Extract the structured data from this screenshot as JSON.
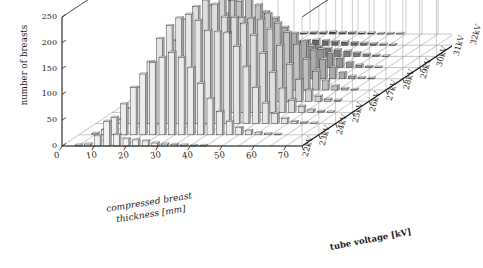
{
  "figure": {
    "type": "3d-bar-histogram",
    "background": "#ffffff",
    "ink": "#1a1a1a"
  },
  "axes": {
    "y": {
      "label": "number of breasts",
      "ticks": [
        "0",
        "50",
        "100",
        "150",
        "200",
        "250"
      ],
      "tick_values": [
        0,
        50,
        100,
        150,
        200,
        250
      ],
      "range": [
        0,
        250
      ]
    },
    "x": {
      "label_line1": "compressed breast",
      "label_line2": "thickness [mm]",
      "label": "compressed breast thickness [mm]",
      "ticks": [
        "0",
        "10",
        "20",
        "30",
        "40",
        "50",
        "60",
        "70"
      ],
      "tick_values": [
        0,
        10,
        20,
        30,
        40,
        50,
        60,
        70
      ],
      "range": [
        0,
        75
      ]
    },
    "z": {
      "label": "tube voltage [kV]",
      "ticks": [
        "22kV",
        "23kV",
        "24kV",
        "25kV",
        "26kV",
        "27kV",
        "28kV",
        "29kV",
        "30kV",
        "31kV",
        "32kV"
      ],
      "tick_values": [
        22,
        23,
        24,
        25,
        26,
        27,
        28,
        29,
        30,
        31,
        32
      ]
    }
  },
  "chart_data": {
    "type": "bar",
    "title": "",
    "subtitle": "",
    "xlabel": "compressed breast thickness [mm]",
    "ylabel": "number of breasts",
    "zlabel": "tube voltage [kV]",
    "xlim": [
      0,
      75
    ],
    "ylim": [
      0,
      250
    ],
    "grid": true,
    "legend_position": "none",
    "projection": "3d",
    "categories": [
      2,
      5,
      8,
      11,
      14,
      17,
      20,
      23,
      26,
      29,
      32,
      35,
      38,
      41,
      44,
      47,
      50,
      53,
      56,
      59,
      62,
      65,
      68,
      71
    ],
    "series": [
      {
        "name": "22kV",
        "z": 22,
        "color": "#f2f2f2",
        "values": [
          0,
          2,
          4,
          20,
          48,
          22,
          14,
          12,
          10,
          6,
          4,
          3,
          2,
          1,
          1,
          0,
          0,
          0,
          0,
          0,
          0,
          0,
          0,
          0
        ]
      },
      {
        "name": "23kV",
        "z": 23,
        "color": "#ededed",
        "values": [
          0,
          3,
          10,
          34,
          60,
          92,
          118,
          140,
          150,
          160,
          150,
          130,
          100,
          70,
          45,
          26,
          14,
          8,
          4,
          2,
          1,
          0,
          0,
          0
        ]
      },
      {
        "name": "24kV",
        "z": 24,
        "color": "#e6e6e6",
        "values": [
          0,
          2,
          8,
          30,
          70,
          120,
          165,
          190,
          205,
          212,
          200,
          180,
          178,
          176,
          150,
          110,
          70,
          40,
          20,
          10,
          4,
          2,
          1,
          0
        ]
      },
      {
        "name": "25kV",
        "z": 25,
        "color": "#dedede",
        "values": [
          0,
          1,
          5,
          18,
          50,
          95,
          140,
          180,
          205,
          218,
          210,
          185,
          184,
          172,
          150,
          115,
          78,
          46,
          24,
          12,
          5,
          2,
          1,
          0
        ]
      },
      {
        "name": "26kV",
        "z": 26,
        "color": "#d2d2d2",
        "values": [
          0,
          1,
          3,
          10,
          30,
          62,
          105,
          150,
          186,
          222,
          195,
          162,
          160,
          158,
          140,
          108,
          72,
          42,
          22,
          10,
          4,
          2,
          0,
          0
        ]
      },
      {
        "name": "27kV",
        "z": 27,
        "color": "#c2c2c2",
        "values": [
          0,
          0,
          2,
          6,
          18,
          40,
          72,
          110,
          148,
          172,
          192,
          165,
          148,
          130,
          112,
          88,
          60,
          36,
          18,
          8,
          3,
          1,
          0,
          0
        ]
      },
      {
        "name": "28kV",
        "z": 28,
        "color": "#ababab",
        "values": [
          0,
          0,
          1,
          3,
          9,
          22,
          42,
          68,
          96,
          118,
          130,
          118,
          100,
          88,
          72,
          55,
          38,
          22,
          12,
          5,
          2,
          1,
          0,
          0
        ]
      },
      {
        "name": "29kV",
        "z": 29,
        "color": "#949494",
        "values": [
          0,
          0,
          0,
          2,
          5,
          12,
          22,
          36,
          50,
          58,
          62,
          56,
          48,
          42,
          36,
          28,
          18,
          10,
          5,
          2,
          1,
          0,
          0,
          0
        ]
      },
      {
        "name": "30kV",
        "z": 30,
        "color": "#7d7d7d",
        "values": [
          0,
          0,
          0,
          1,
          2,
          5,
          9,
          14,
          20,
          24,
          26,
          23,
          19,
          16,
          13,
          10,
          7,
          4,
          2,
          1,
          0,
          0,
          0,
          0
        ]
      },
      {
        "name": "31kV",
        "z": 31,
        "color": "#666666",
        "values": [
          0,
          0,
          0,
          0,
          1,
          2,
          3,
          5,
          7,
          9,
          10,
          9,
          7,
          6,
          5,
          4,
          3,
          2,
          1,
          0,
          0,
          0,
          0,
          0
        ]
      },
      {
        "name": "32kV",
        "z": 32,
        "color": "#4d4d4d",
        "values": [
          0,
          0,
          0,
          0,
          0,
          1,
          1,
          2,
          3,
          3,
          4,
          3,
          3,
          2,
          2,
          1,
          1,
          1,
          0,
          0,
          0,
          0,
          0,
          0
        ]
      }
    ]
  }
}
